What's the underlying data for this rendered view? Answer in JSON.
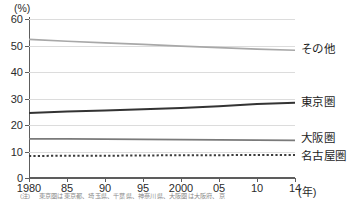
{
  "axes": {
    "y_unit_label": "(%)",
    "x_unit_label": "(年)",
    "y_ticks": [
      "0",
      "10",
      "20",
      "30",
      "40",
      "50",
      "60"
    ],
    "x_ticks": [
      "1980",
      "85",
      "90",
      "95",
      "2000",
      "05",
      "10",
      "14"
    ]
  },
  "footnote": {
    "marker": "(注)",
    "body": "東京圏は東京都、埼玉県、千葉県、神奈川県、大阪圏は大阪府、京"
  },
  "colors": {
    "sonota": "#a8a8a8",
    "tokyo": "#333333",
    "osaka": "#7a7a7a",
    "nagoya": "#3c3c3c",
    "grid": "#dcdcdc",
    "axis": "#5d5d5d"
  },
  "chart_data": {
    "type": "line",
    "title": "",
    "xlabel": "(年)",
    "ylabel": "(%)",
    "xlim": [
      1980,
      14
    ],
    "ylim": [
      0,
      60
    ],
    "grid": true,
    "legend_position": "right-inline",
    "x": [
      1980,
      1985,
      1990,
      1995,
      2000,
      2005,
      2010,
      2014
    ],
    "x_tick_labels": [
      "1980",
      "85",
      "90",
      "95",
      "2000",
      "05",
      "10",
      "14"
    ],
    "series": [
      {
        "name": "その他",
        "style": "solid",
        "color": "#a8a8a8",
        "label_value": "48.2",
        "values": [
          52.3,
          51.6,
          51.0,
          50.4,
          49.8,
          49.2,
          48.6,
          48.2
        ]
      },
      {
        "name": "東京圏",
        "style": "solid",
        "color": "#333333",
        "label_value": "28.4",
        "values": [
          24.5,
          25.1,
          25.5,
          25.9,
          26.4,
          27.1,
          27.9,
          28.4
        ]
      },
      {
        "name": "大阪圏",
        "style": "solid",
        "color": "#7a7a7a",
        "label_value": "14.2",
        "values": [
          14.8,
          14.8,
          14.7,
          14.6,
          14.5,
          14.4,
          14.3,
          14.2
        ]
      },
      {
        "name": "名古屋圏",
        "style": "dotted",
        "color": "#3c3c3c",
        "label_value": "8.7",
        "values": [
          8.3,
          8.4,
          8.4,
          8.5,
          8.6,
          8.6,
          8.7,
          8.7
        ]
      }
    ]
  }
}
